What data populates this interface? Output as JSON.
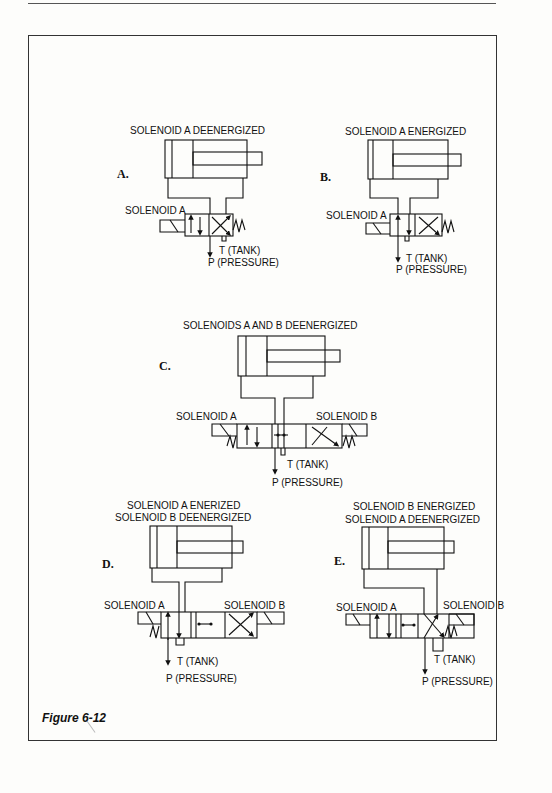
{
  "figure": {
    "caption": "Figure 6-12"
  },
  "panels": [
    {
      "id": "A",
      "letter": "A.",
      "title_lines": [
        "SOLENOID A DEENERGIZED"
      ],
      "solenoid_left": "SOLENOID A",
      "tank": "T (TANK)",
      "pressure": "P (PRESSURE)"
    },
    {
      "id": "B",
      "letter": "B.",
      "title_lines": [
        "SOLENOID A ENERGIZED"
      ],
      "solenoid_left": "SOLENOID A",
      "tank": "T (TANK)",
      "pressure": "P (PRESSURE)"
    },
    {
      "id": "C",
      "letter": "C.",
      "title_lines": [
        "SOLENOIDS A AND B DEENERGIZED"
      ],
      "solenoid_left": "SOLENOID A",
      "solenoid_right": "SOLENOID B",
      "tank": "T (TANK)",
      "pressure": "P (PRESSURE)"
    },
    {
      "id": "D",
      "letter": "D.",
      "title_lines": [
        "SOLENOID A ENERIZED",
        "SOLENOID B DEENERGIZED"
      ],
      "solenoid_left": "SOLENOID A",
      "solenoid_right": "SOLENOID B",
      "tank": "T (TANK)",
      "pressure": "P (PRESSURE)"
    },
    {
      "id": "E",
      "letter": "E.",
      "title_lines": [
        "SOLENOID B ENERGIZED",
        "SOLENOID A DEENERGIZED"
      ],
      "solenoid_left": "SOLENOID A",
      "solenoid_right": "SOLENOID B",
      "tank": "T (TANK)",
      "pressure": "P (PRESSURE)"
    }
  ]
}
